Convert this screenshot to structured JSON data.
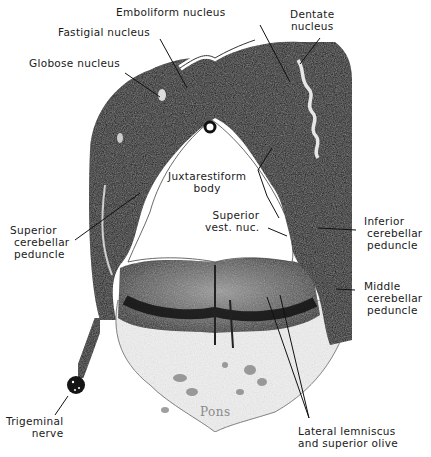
{
  "figure": {
    "colors": {
      "stain_dark": "#111111",
      "stain_mid": "#4a4a4a",
      "background": "#ffffff",
      "pons_label": "#8a8a8a"
    },
    "labels": {
      "emboliform": [
        "Emboliform nucleus"
      ],
      "fastigial": [
        "Fastigial nucleus"
      ],
      "globose": [
        "Globose nucleus"
      ],
      "dentate": [
        "Dentate",
        "nucleus"
      ],
      "juxtarestiform": [
        "Juxtarestiform",
        "body"
      ],
      "superior_vest": [
        "Superior",
        "vest. nuc."
      ],
      "superior_cerebellar": [
        "Superior",
        "cerebellar",
        "peduncle"
      ],
      "inferior_cerebellar": [
        "Inferior",
        "cerebellar",
        "peduncle"
      ],
      "middle_cerebellar": [
        "Middle",
        "cerebellar",
        "peduncle"
      ],
      "trigeminal": [
        "Trigeminal",
        "nerve"
      ],
      "lateral_lemniscus": [
        "Lateral lemniscus",
        "and superior olive"
      ],
      "pons": "Pons"
    }
  }
}
